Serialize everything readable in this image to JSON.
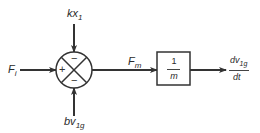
{
  "diagram": {
    "type": "block-diagram",
    "summing_junction": {
      "signs": {
        "left": "+",
        "top": "−",
        "bottom": "−"
      }
    },
    "inputs": {
      "left": {
        "symbol": "F",
        "subscript": "i"
      },
      "top": {
        "symbol": "kx",
        "subscript": "1"
      },
      "bottom": {
        "symbol": "bv",
        "subscript": "1g"
      }
    },
    "intermediate_signal": {
      "symbol": "F",
      "subscript": "m"
    },
    "block": {
      "numerator": "1",
      "denominator": "m"
    },
    "output": {
      "numerator_symbol": "dv",
      "numerator_subscript": "1g",
      "denominator": "dt"
    },
    "colors": {
      "line": "#333333",
      "background": "#ffffff"
    }
  }
}
